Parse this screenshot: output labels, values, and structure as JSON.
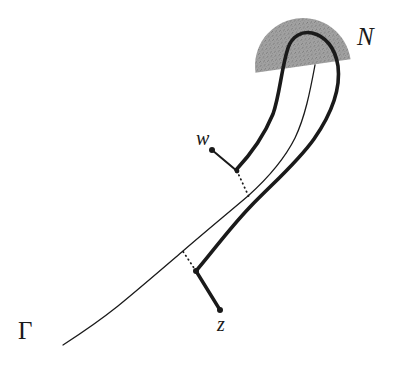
{
  "figure": {
    "caption_labels": {
      "gamma": "Γ",
      "neighborhood": "N",
      "point_w": "w",
      "point_z": "z"
    },
    "colors": {
      "stroke": "#1a1a1a",
      "shade_fill": "#9a9a9a",
      "background": "#ffffff",
      "label_color": "#1a1a1a"
    },
    "elements": {
      "gamma_curve_name": "Γ",
      "tube_boundary_name": "tube boundary",
      "shaded_region_name": "N",
      "dotted_connector_w_name": "dotted projection from w",
      "dotted_connector_z_name": "dotted projection from z"
    }
  },
  "chart_data": {
    "type": "diagram",
    "title": "",
    "curves": [
      {
        "name": "Γ",
        "style": "thin-solid",
        "stroke_width": 1.3,
        "points": [
          [
            63,
            345
          ],
          [
            85,
            330
          ],
          [
            110,
            312
          ],
          [
            136,
            291
          ],
          [
            160,
            270
          ],
          [
            183,
            251
          ],
          [
            205,
            232
          ],
          [
            228,
            212
          ],
          [
            248,
            196
          ],
          [
            266,
            179
          ],
          [
            282,
            160
          ],
          [
            294,
            139
          ],
          [
            302,
            116
          ],
          [
            308,
            93
          ],
          [
            313,
            74
          ],
          [
            315,
            65
          ]
        ]
      },
      {
        "name": "tube-boundary-left",
        "style": "thick-solid",
        "stroke_width": 3.6,
        "points": [
          [
            236,
            170
          ],
          [
            247,
            158
          ],
          [
            258,
            144
          ],
          [
            268,
            128
          ],
          [
            275,
            110
          ],
          [
            280,
            92
          ],
          [
            283,
            74
          ],
          [
            285,
            60
          ],
          [
            288,
            47
          ],
          [
            294,
            38
          ],
          [
            303,
            33
          ]
        ]
      },
      {
        "name": "tube-boundary-cap",
        "style": "thick-solid",
        "stroke_width": 3.6,
        "points": [
          [
            303,
            33
          ],
          [
            315,
            33
          ],
          [
            326,
            39
          ],
          [
            333,
            49
          ],
          [
            337,
            62
          ],
          [
            338,
            75
          ]
        ]
      },
      {
        "name": "tube-boundary-right",
        "style": "thick-solid",
        "stroke_width": 3.6,
        "points": [
          [
            338,
            75
          ],
          [
            336,
            93
          ],
          [
            330,
            112
          ],
          [
            322,
            130
          ],
          [
            311,
            146
          ],
          [
            298,
            160
          ],
          [
            283,
            173
          ],
          [
            268,
            187
          ],
          [
            253,
            203
          ],
          [
            239,
            220
          ],
          [
            226,
            238
          ],
          [
            213,
            254
          ],
          [
            202,
            265
          ],
          [
            196,
            271
          ]
        ]
      }
    ],
    "segments": [
      {
        "name": "w-to-tube",
        "style": "thin-solid",
        "stroke_width": 2.0,
        "from": [
          212,
          150
        ],
        "to": [
          237,
          171
        ]
      },
      {
        "name": "w-dotted-to-gamma",
        "style": "dotted",
        "stroke_width": 1.8,
        "from": [
          237,
          171
        ],
        "to": [
          249,
          197
        ]
      },
      {
        "name": "z-to-tube",
        "style": "thick-solid",
        "stroke_width": 3.4,
        "from": [
          220,
          310
        ],
        "to": [
          196,
          271
        ]
      },
      {
        "name": "z-dotted-to-gamma",
        "style": "dotted",
        "stroke_width": 1.8,
        "from": [
          196,
          271
        ],
        "to": [
          182,
          250
        ]
      }
    ],
    "points": [
      {
        "name": "w",
        "x": 212,
        "y": 150,
        "radius": 3.0
      },
      {
        "name": "z",
        "x": 220,
        "y": 310,
        "radius": 3.0
      },
      {
        "name": "tube-corner-near-w",
        "x": 237,
        "y": 171,
        "radius": 2.4
      },
      {
        "name": "tube-corner-near-z",
        "x": 196,
        "y": 271,
        "radius": 3.0
      }
    ],
    "shaded_region": {
      "name": "N",
      "shape": "half-disc",
      "center": [
        303,
        66
      ],
      "radius": 48,
      "rotation_deg": -8,
      "fill": "#9a9a9a",
      "texture": "stipple"
    },
    "labels": [
      {
        "text": "Γ",
        "x": 26,
        "y": 332,
        "font_style": "upright-serif",
        "font_size": 25
      },
      {
        "text": "N",
        "x": 366,
        "y": 38,
        "font_style": "italic-serif",
        "font_size": 25
      },
      {
        "text": "w",
        "x": 204,
        "y": 138,
        "font_style": "italic-serif",
        "font_size": 20
      },
      {
        "text": "z",
        "x": 224,
        "y": 324,
        "font_style": "italic-serif",
        "font_size": 20
      }
    ]
  }
}
